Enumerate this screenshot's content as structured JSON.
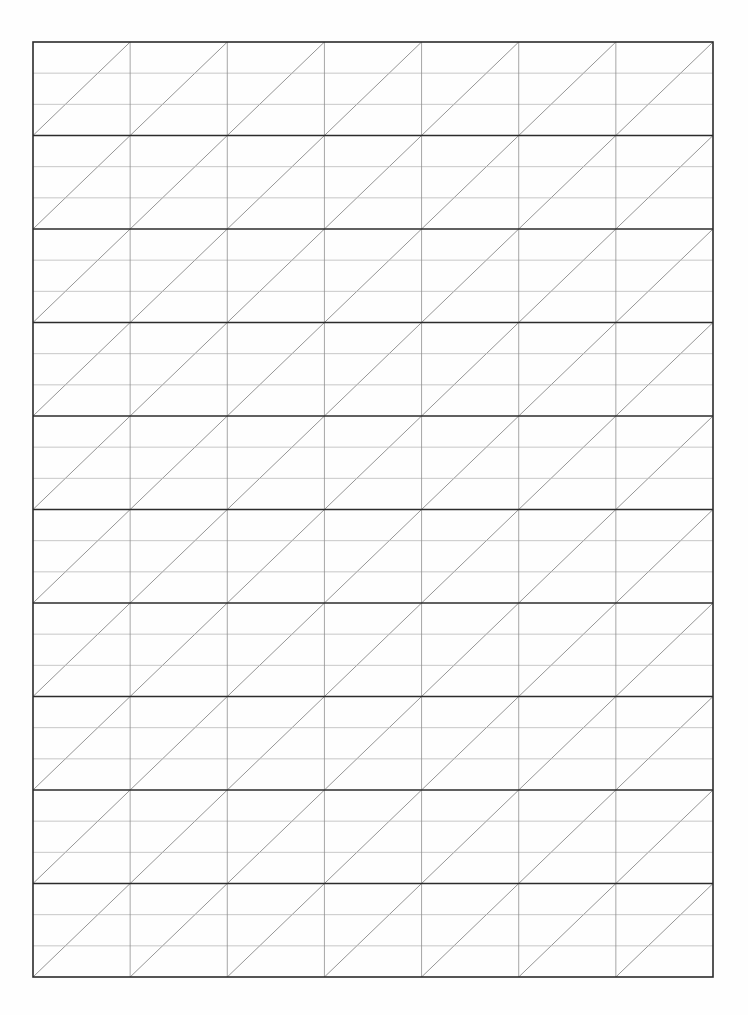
{
  "document": {
    "title": "Slant Guide Practice Sheet",
    "kind": "handwriting-practice-grid",
    "page_width": 748,
    "page_height": 1015,
    "background_color": "#fefefe"
  },
  "grid": {
    "origin_x": 33,
    "origin_y": 42,
    "width": 680,
    "height": 935,
    "columns": 7,
    "rows": 10,
    "cell_width": 97.14,
    "cell_height": 93.5,
    "subdivisions_per_row": 3,
    "sub_line_count_per_row": 2,
    "sub_row_height": 31.17,
    "diagonal_direction": "bottom-left-to-top-right",
    "diagonals_per_cell": 1
  },
  "style": {
    "major_line_color": "#2b2b2b",
    "major_line_width": 1.6,
    "minor_line_color": "#b9b9b9",
    "minor_line_width": 0.8,
    "vertical_line_color": "#8f8f8f",
    "vertical_line_width": 0.8,
    "diagonal_line_color": "#7a7a7a",
    "diagonal_line_width": 0.8,
    "border_color": "#2b2b2b",
    "border_width": 1.6
  },
  "labels": {
    "sheet_name": "Slant Guide Practice Sheet",
    "column_header": "",
    "row_header": "",
    "footer_note": ""
  }
}
